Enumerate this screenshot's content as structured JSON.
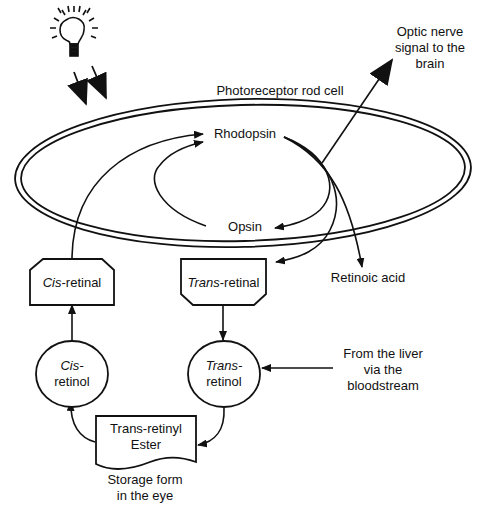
{
  "diagram": {
    "title": "Photoreceptor rod cell",
    "nodes": {
      "rhodopsin": "Rhodopsin",
      "opsin": "Opsin",
      "retinoic_acid": "Retinoic acid",
      "cis_retinal": {
        "italic": "Cis",
        "rest": "-retinal"
      },
      "trans_retinal": {
        "italic": "Trans",
        "rest": "-retinal"
      },
      "cis_retinol": {
        "italic": "Cis-",
        "rest": "retinol"
      },
      "trans_retinol": {
        "italic": "Trans-",
        "rest": "retinol"
      },
      "ester": {
        "line1": "Trans-retinyl",
        "line2": "Ester"
      }
    },
    "annotations": {
      "optic_nerve": [
        "Optic nerve",
        "signal to the",
        "brain"
      ],
      "liver": [
        "From the liver",
        "via the",
        "bloodstream"
      ],
      "storage": [
        "Storage form",
        "in the eye"
      ]
    },
    "icons": [
      "light-bulb-icon",
      "light-ray-arrow-icon"
    ],
    "colors": {
      "stroke": "#111111",
      "background": "#ffffff"
    }
  }
}
